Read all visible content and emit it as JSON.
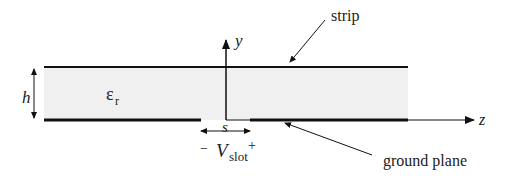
{
  "diagram": {
    "labels": {
      "strip": "strip",
      "ground_plane": "ground plane",
      "height": "h",
      "permittivity_main": "ε",
      "permittivity_sub": "r",
      "y_axis": "y",
      "z_axis": "z",
      "slot_width": "s",
      "slot_minus": "−",
      "slot_voltage_main": "V",
      "slot_voltage_sub": "slot",
      "slot_plus": "+"
    },
    "colors": {
      "substrate_fill": "#f0f0f0",
      "line": "#111111"
    }
  }
}
